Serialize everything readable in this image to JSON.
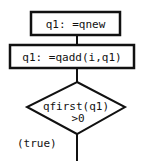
{
  "flowchart": {
    "nodes": [
      {
        "id": "n1",
        "type": "process",
        "label": "q1: =qnew"
      },
      {
        "id": "n2",
        "type": "process",
        "label": "q1: =qadd(i,q1)"
      },
      {
        "id": "n3",
        "type": "decision",
        "label_line1": "qfirst(q1)",
        "label_line2": ">0"
      }
    ],
    "edges": [
      {
        "from": "n1",
        "to": "n2"
      },
      {
        "from": "n2",
        "to": "n3"
      },
      {
        "from": "n3",
        "to": "next",
        "label": "(true)"
      }
    ]
  },
  "colors": {
    "stroke": "#111111",
    "background": "#ffffff"
  }
}
